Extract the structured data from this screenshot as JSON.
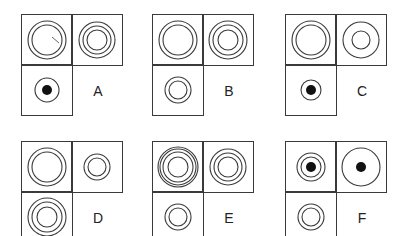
{
  "figure": {
    "panels": [
      {
        "label": "A",
        "cells": {
          "top_left": {
            "rings": [
              19,
              15
            ],
            "dot": 0,
            "tick": true
          },
          "top_right": {
            "rings": [
              18,
              14,
              10
            ],
            "dot": 0
          },
          "bottom_left": {
            "rings": [
              12
            ],
            "dot": 5
          }
        }
      },
      {
        "label": "B",
        "cells": {
          "top_left": {
            "rings": [
              19,
              15
            ],
            "dot": 0
          },
          "top_right": {
            "rings": [
              19,
              15,
              10
            ],
            "dot": 0
          },
          "bottom_left": {
            "rings": [
              13,
              9
            ],
            "dot": 0
          }
        }
      },
      {
        "label": "C",
        "cells": {
          "top_left": {
            "rings": [
              19,
              15
            ],
            "dot": 0
          },
          "top_right": {
            "rings": [
              18,
              9
            ],
            "dot": 0
          },
          "bottom_left": {
            "rings": [
              10
            ],
            "dot": 5
          }
        }
      },
      {
        "label": "D",
        "cells": {
          "top_left": {
            "rings": [
              19,
              15
            ],
            "dot": 0
          },
          "top_right": {
            "rings": [
              13,
              9
            ],
            "dot": 0
          },
          "bottom_left": {
            "rings": [
              19,
              15,
              10
            ],
            "dot": 0
          }
        }
      },
      {
        "label": "E",
        "cells": {
          "top_left": {
            "rings": [
              20,
              18,
              15,
              10
            ],
            "dot": 0
          },
          "top_right": {
            "rings": [
              18,
              14,
              10
            ],
            "dot": 0
          },
          "bottom_left": {
            "rings": [
              13,
              9
            ],
            "dot": 0
          }
        }
      },
      {
        "label": "F",
        "cells": {
          "top_left": {
            "rings": [
              14,
              10
            ],
            "dot": 5
          },
          "top_right": {
            "rings": [
              19
            ],
            "dot": 5
          },
          "bottom_left": {
            "rings": [
              13,
              9
            ],
            "dot": 0
          }
        }
      }
    ]
  }
}
